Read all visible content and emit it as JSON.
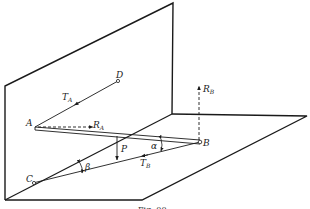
{
  "diagram": {
    "type": "statics-3d",
    "stroke_color": "#1a1a1a",
    "background": "#ffffff",
    "points": {
      "A": {
        "label": "A",
        "x": 35,
        "y": 127
      },
      "B": {
        "label": "B",
        "x": 200,
        "y": 142
      },
      "C": {
        "label": "C",
        "x": 33,
        "y": 183
      },
      "D": {
        "label": "D",
        "x": 118,
        "y": 81
      }
    },
    "forces": {
      "T_A": {
        "label": "T",
        "sub": "A"
      },
      "R_A": {
        "label": "R",
        "sub": "A"
      },
      "R_B": {
        "label": "R",
        "sub": "B"
      },
      "T_B": {
        "label": "T",
        "sub": "B"
      },
      "P": {
        "label": "P"
      }
    },
    "angles": {
      "alpha": {
        "label": "α"
      },
      "beta": {
        "label": "β"
      }
    },
    "caption": "Fig. 00"
  }
}
